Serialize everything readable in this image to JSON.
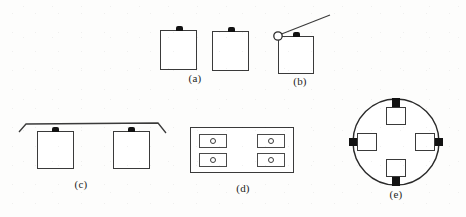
{
  "figure": {
    "width": 466,
    "height": 217,
    "background_color": "#fdfdfc",
    "line_color": "#3a3a3a",
    "tab_color": "#121212",
    "caption_color": "#1d1d1d"
  },
  "panels": [
    {
      "id": "a",
      "caption": "(a)",
      "description": "Two free-standing square plates, each with a small dark tab centered on the top edge",
      "plate_count": 2
    },
    {
      "id": "b",
      "caption": "(b)",
      "description": "A single square plate with a dark tab on the top edge, plus a hollow circle at the upper-left corner connected to a diagonal straight line angled up and to the right",
      "plate_count": 1,
      "has_pivot_circle": true,
      "has_diagonal_arm": true
    },
    {
      "id": "c",
      "caption": "(c)",
      "description": "A horizontal beam with both ends bent downward, supporting two square plates hanging below; each plate has a dark tab on its top edge",
      "plate_count": 2,
      "has_beam": true
    },
    {
      "id": "d",
      "caption": "(d)",
      "description": "A large outer rectangle containing four small rectangles arranged two per side, each enclosing a small circle",
      "cell_count": 4,
      "cell_layout": "2x2"
    },
    {
      "id": "e",
      "caption": "(e)",
      "description": "A large circle with four small square plates positioned at the top, right, bottom and left, each joined to the circle by a thick dark tab pointing outward",
      "plate_count": 4,
      "plate_positions": [
        "top",
        "right",
        "bottom",
        "left"
      ]
    }
  ]
}
